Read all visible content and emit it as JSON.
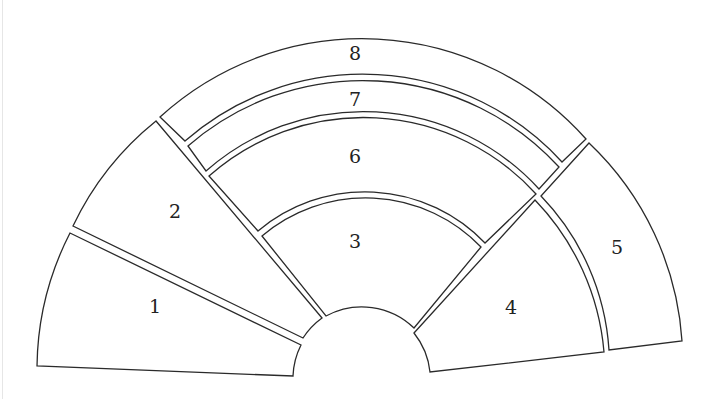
{
  "diagram": {
    "type": "sector-layout",
    "line_color": "#2a2a2a",
    "background": "#ffffff",
    "regions": [
      {
        "id": 1,
        "label": "1",
        "position": "lower-left sector"
      },
      {
        "id": 2,
        "label": "2",
        "position": "upper-left sector"
      },
      {
        "id": 3,
        "label": "3",
        "position": "center inner band"
      },
      {
        "id": 4,
        "label": "4",
        "position": "lower-right inner sector"
      },
      {
        "id": 5,
        "label": "5",
        "position": "right outer sector"
      },
      {
        "id": 6,
        "label": "6",
        "position": "center middle band"
      },
      {
        "id": 7,
        "label": "7",
        "position": "center narrow band"
      },
      {
        "id": 8,
        "label": "8",
        "position": "top outer band"
      }
    ]
  }
}
